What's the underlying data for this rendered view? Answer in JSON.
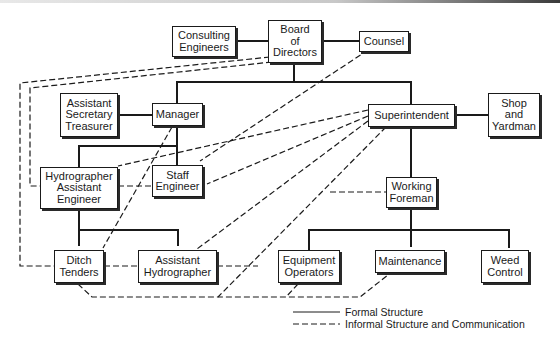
{
  "diagram": {
    "type": "organizational-chart",
    "nodes": {
      "board": "Board\nof\nDirectors",
      "consulting": "Consulting\nEngineers",
      "counsel": "Counsel",
      "asst_sec": "Assistant\nSecretary\nTreasurer",
      "manager": "Manager",
      "superintendent": "Superintendent",
      "shop": "Shop\nand\nYardman",
      "hydrographer": "Hydrographer\nAssistant\nEngineer",
      "staff_eng": "Staff\nEngineer",
      "working_foreman": "Working\nForeman",
      "ditch": "Ditch\nTenders",
      "asst_hydro": "Assistant\nHydrographer",
      "equipment": "Equipment\nOperators",
      "maintenance": "Maintenance",
      "weed": "Weed\nControl"
    },
    "formal_edges": [
      [
        "consulting",
        "board"
      ],
      [
        "board",
        "counsel"
      ],
      [
        "board",
        "manager"
      ],
      [
        "board",
        "superintendent"
      ],
      [
        "asst_sec",
        "manager"
      ],
      [
        "manager",
        "staff_eng"
      ],
      [
        "manager",
        "hydrographer"
      ],
      [
        "superintendent",
        "shop"
      ],
      [
        "superintendent",
        "working_foreman"
      ],
      [
        "hydrographer",
        "ditch"
      ],
      [
        "hydrographer",
        "asst_hydro"
      ],
      [
        "working_foreman",
        "equipment"
      ],
      [
        "working_foreman",
        "maintenance"
      ],
      [
        "working_foreman",
        "weed"
      ]
    ],
    "informal_edges": [
      [
        "board",
        "ditch"
      ],
      [
        "board",
        "hydrographer"
      ],
      [
        "counsel",
        "staff_eng"
      ],
      [
        "superintendent",
        "hydrographer"
      ],
      [
        "superintendent",
        "staff_eng"
      ],
      [
        "superintendent",
        "asst_hydro"
      ],
      [
        "superintendent",
        "equipment"
      ],
      [
        "manager",
        "ditch"
      ],
      [
        "hydrographer",
        "staff_eng"
      ],
      [
        "working_foreman",
        "superintendent-link"
      ],
      [
        "ditch",
        "asst_hydro"
      ],
      [
        "asst_hydro",
        "equipment"
      ],
      [
        "ditch",
        "maintenance"
      ],
      [
        "equipment",
        "bottom-link"
      ]
    ]
  },
  "legend": {
    "formal": "Formal Structure",
    "informal": "Informal Structure and Communication"
  }
}
